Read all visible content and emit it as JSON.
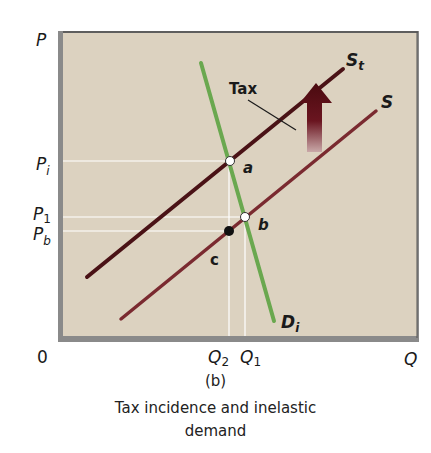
{
  "figure": {
    "panel_label": "(b)",
    "caption_line1": "Tax incidence and inelastic",
    "caption_line2": "demand"
  },
  "axes": {
    "y_label": "P",
    "x_label": "Q",
    "origin_label": "0",
    "y_ticks": [
      {
        "main": "P",
        "sub": "i",
        "key": "Pi"
      },
      {
        "main": "P",
        "sub": "1",
        "key": "P1"
      },
      {
        "main": "P",
        "sub": "b",
        "key": "Pb"
      }
    ],
    "x_ticks": [
      {
        "main": "Q",
        "sub": "2",
        "key": "Q2"
      },
      {
        "main": "Q",
        "sub": "1",
        "key": "Q1"
      }
    ]
  },
  "curves": {
    "supply_tax": {
      "label": "S",
      "sub": "t",
      "color": "#4a1216"
    },
    "supply": {
      "label": "S",
      "color": "#7a2a30"
    },
    "demand": {
      "label": "D",
      "sub": "i",
      "color": "#6aa84f"
    }
  },
  "annotations": {
    "tax_label": "Tax",
    "point_a": "a",
    "point_b": "b",
    "point_c": "c"
  },
  "colors": {
    "plot_background": "#dcd2c0",
    "frame_shadow": "#8a8a8a",
    "arrow": "#5a0f14"
  }
}
